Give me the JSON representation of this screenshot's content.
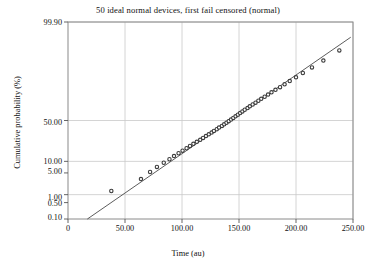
{
  "chart_data": {
    "type": "scatter",
    "title": "50 ideal normal devices, first fail censored (normal)",
    "xlabel": "Time (au)",
    "ylabel": "Cumulative probability (%)",
    "xlim": [
      0,
      250
    ],
    "ylim_percent": [
      0.1,
      99.9
    ],
    "yscale": "normal-probability",
    "grid": true,
    "legend": "none",
    "xticks": [
      0,
      50,
      100,
      150,
      200,
      250
    ],
    "xtick_labels": [
      "0",
      "50.00",
      "100.00",
      "150.00",
      "200.00",
      "250.00"
    ],
    "yticks": [
      99.9,
      50.0,
      10.0,
      5.0,
      1.0,
      0.5,
      0.1
    ],
    "ytick_labels": [
      "99.90",
      "50.00",
      "10.00",
      "5.00",
      "1.00",
      "0.50",
      "0.10"
    ],
    "series": [
      {
        "name": "observed failures",
        "type": "scatter",
        "marker": "circle",
        "color": "#3b3b3b",
        "x": [
          38.0,
          64.0,
          72.0,
          78.0,
          84.0,
          89.0,
          93.0,
          97.0,
          100.5,
          104.0,
          107.0,
          110.0,
          113.0,
          116.0,
          118.5,
          121.0,
          123.5,
          126.0,
          128.0,
          130.5,
          132.5,
          135.0,
          137.0,
          139.0,
          141.0,
          143.0,
          145.0,
          147.0,
          149.0,
          151.0,
          153.0,
          155.0,
          157.5,
          159.5,
          162.0,
          164.5,
          167.0,
          169.5,
          172.5,
          175.5,
          178.5,
          182.0,
          186.0,
          190.0,
          194.5,
          200.0,
          206.0,
          214.0,
          224.0,
          238.0
        ],
        "y_percent": [
          1.35,
          3.3,
          5.3,
          7.25,
          9.25,
          11.2,
          13.2,
          15.2,
          17.2,
          19.2,
          21.2,
          23.2,
          25.2,
          27.2,
          29.2,
          31.2,
          33.2,
          35.2,
          37.2,
          39.2,
          41.2,
          43.2,
          45.2,
          47.2,
          49.2,
          51.2,
          53.2,
          55.2,
          57.2,
          59.2,
          61.2,
          63.2,
          65.2,
          67.2,
          69.2,
          71.2,
          73.2,
          75.2,
          77.2,
          79.2,
          81.2,
          83.2,
          85.2,
          87.2,
          89.2,
          91.2,
          93.2,
          95.2,
          97.0,
          98.6
        ]
      },
      {
        "name": "fitted normal line",
        "type": "line",
        "color": "#4a4a4a",
        "x": [
          17.0,
          248.0
        ],
        "y_percent": [
          0.1,
          99.55
        ]
      }
    ]
  },
  "axes": {
    "frame_color": "#8a8a8a",
    "grid_color": "#c9c9c9",
    "background": "#ffffff"
  }
}
